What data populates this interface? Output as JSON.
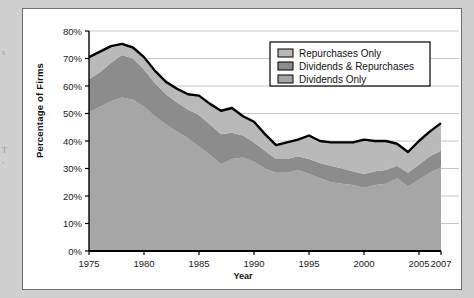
{
  "figure": {
    "background_color": "#cfcfcf",
    "panel_color": "#ffffff",
    "border_color": "#6e6e6e"
  },
  "edge_ghosts": [
    {
      "text": "s",
      "top": 48
    },
    {
      "text": "T",
      "top": 146
    },
    {
      "text": ",",
      "top": 156
    }
  ],
  "chart_data": {
    "type": "area",
    "stacked": true,
    "title": "",
    "xlabel": "Year",
    "ylabel": "Percentage of Firms",
    "xlim": [
      1975,
      2007
    ],
    "ylim": [
      0,
      80
    ],
    "ytick_labels": [
      "0%",
      "10%",
      "20%",
      "30%",
      "40%",
      "50%",
      "60%",
      "70%",
      "80%"
    ],
    "ytick_values": [
      0,
      10,
      20,
      30,
      40,
      50,
      60,
      70,
      80
    ],
    "xtick_labels": [
      "1975",
      "1980",
      "1985",
      "1990",
      "1995",
      "2000",
      "2005",
      "2007"
    ],
    "xtick_values": [
      1975,
      1980,
      1985,
      1990,
      1995,
      2000,
      2005,
      2007
    ],
    "grid": "horizontal",
    "grid_color": "#b8b8b8",
    "legend_position": "top-right",
    "x": [
      1975,
      1976,
      1977,
      1978,
      1979,
      1980,
      1981,
      1982,
      1983,
      1984,
      1985,
      1986,
      1987,
      1988,
      1989,
      1990,
      1991,
      1992,
      1993,
      1994,
      1995,
      1996,
      1997,
      1998,
      1999,
      2000,
      2001,
      2002,
      2003,
      2004,
      2005,
      2006,
      2007
    ],
    "series": [
      {
        "name": "Dividends Only",
        "color": "#a6a6a6",
        "values": [
          50.5,
          52.5,
          54.5,
          55.8,
          55.0,
          52.5,
          49.0,
          46.0,
          43.5,
          41.0,
          38.0,
          35.0,
          31.5,
          33.5,
          34.0,
          32.5,
          30.0,
          28.5,
          28.5,
          29.5,
          28.0,
          26.5,
          25.0,
          24.5,
          24.0,
          23.0,
          24.0,
          24.5,
          26.5,
          23.5,
          26.0,
          28.5,
          30.5
        ]
      },
      {
        "name": "Dividends & Repurchases",
        "color": "#8c8c8c",
        "values": [
          12.0,
          12.5,
          14.0,
          15.5,
          15.0,
          13.5,
          12.0,
          11.0,
          10.5,
          10.5,
          11.5,
          11.0,
          11.0,
          9.5,
          8.0,
          7.0,
          6.5,
          5.0,
          5.0,
          5.0,
          5.5,
          5.5,
          6.0,
          5.5,
          5.0,
          5.0,
          5.0,
          5.0,
          4.5,
          5.0,
          5.5,
          6.0,
          6.0
        ]
      },
      {
        "name": "Repurchases Only",
        "color": "#b9b9b9",
        "values": [
          8.0,
          7.5,
          6.0,
          4.0,
          4.0,
          4.5,
          4.5,
          4.5,
          5.0,
          5.5,
          7.0,
          7.5,
          8.5,
          9.0,
          7.0,
          7.5,
          6.0,
          5.0,
          6.0,
          6.0,
          8.5,
          8.0,
          8.5,
          9.5,
          10.5,
          12.5,
          11.0,
          10.5,
          8.0,
          7.5,
          8.5,
          9.0,
          10.0
        ]
      }
    ],
    "total_outline": {
      "name": "Total (payers)",
      "color": "#000000",
      "values": [
        70.5,
        72.5,
        74.5,
        75.3,
        74.0,
        70.5,
        65.5,
        61.5,
        59.0,
        57.0,
        56.5,
        53.5,
        51.0,
        52.0,
        49.0,
        47.0,
        42.5,
        38.5,
        39.5,
        40.5,
        42.0,
        40.0,
        39.5,
        39.5,
        39.5,
        40.5,
        40.0,
        40.0,
        39.0,
        36.0,
        40.0,
        43.5,
        46.5
      ]
    },
    "legend": [
      {
        "label": "Repurchases Only",
        "color": "#b9b9b9"
      },
      {
        "label": "Dividends & Repurchases",
        "color": "#8c8c8c"
      },
      {
        "label": "Dividends Only",
        "color": "#a6a6a6"
      }
    ]
  }
}
